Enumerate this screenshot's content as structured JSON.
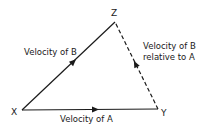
{
  "diagram": {
    "type": "vector-triangle",
    "vertices": {
      "X": {
        "label": "X"
      },
      "Y": {
        "label": "Y"
      },
      "Z": {
        "label": "Z"
      }
    },
    "vectors": [
      {
        "from": "X",
        "to": "Z",
        "style": "solid",
        "label": "Velocity of B"
      },
      {
        "from": "X",
        "to": "Y",
        "style": "solid",
        "label": "Velocity of A"
      },
      {
        "from": "Y",
        "to": "Z",
        "style": "dashed",
        "label_line1": "Velocity of B",
        "label_line2": "relative to A"
      }
    ],
    "colors": {
      "line": "#1a1a1a",
      "background": "#ffffff"
    }
  }
}
